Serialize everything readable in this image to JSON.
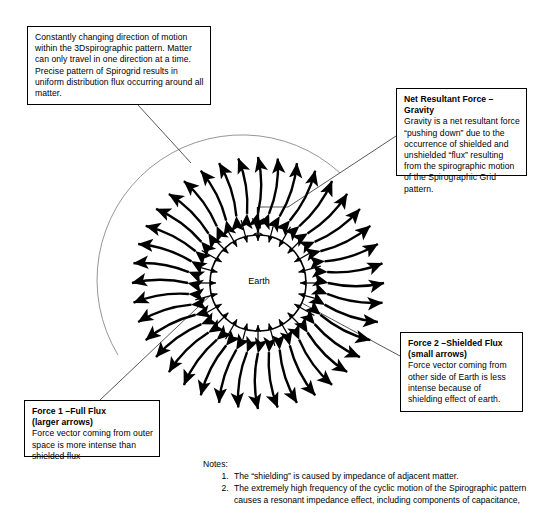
{
  "diagram": {
    "center_label": "Earth",
    "ink_color": "#000000",
    "background_color": "#ffffff"
  },
  "callouts": {
    "spirographic_motion": {
      "header": "",
      "body": "Constantly changing direction of motion within the 3Dspirographic pattern. Matter can only travel in one direction at a time.  Precise pattern of Spirogrid results in uniform distribution flux occurring around all matter."
    },
    "net_resultant_force": {
      "header": "Net Resultant Force – Gravity",
      "body": "Gravity is a net resultant force “pushing down” due to the occurrence of shielded and unshielded “flux” resulting from the spirographic motion of the Spirographic Grid pattern."
    },
    "force_two": {
      "header": "Force 2 –Shielded Flux (small arrows)",
      "header_line1": "Force 2 –Shielded Flux",
      "header_line2": "(small arrows)",
      "body": "Force vector coming from other side of Earth is less intense because of shielding effect of earth."
    },
    "force_one": {
      "header": "Force 1 –Full Flux (larger arrows)",
      "header_line1": "Force 1 –Full Flux",
      "header_line2": "(larger arrows)",
      "body": "Force vector coming from outer space is more intense than shielded flux"
    }
  },
  "notes": {
    "title": "Notes:",
    "items": [
      "The “shielding” is caused by impedance of adjacent matter.",
      "The extremely high frequency of the cyclic motion of the Spirographic pattern causes a resonant impedance effect, including components of capacitance,"
    ]
  },
  "figure": {
    "earth_center_x": 258,
    "earth_center_y": 283,
    "earth_radius": 48,
    "inner_arrow_count": 24,
    "outer_arrow_count": 40,
    "outer_ring_inner_radius": 70,
    "outer_ring_outer_radius": 126
  }
}
